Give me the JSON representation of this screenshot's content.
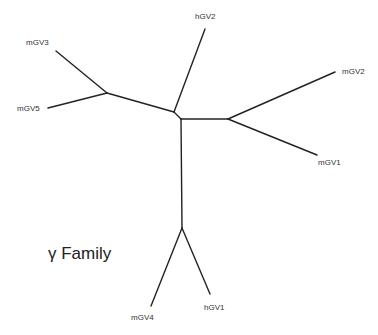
{
  "diagram": {
    "type": "unrooted phylogenetic tree",
    "title": "γ Family",
    "leaves": [
      {
        "id": "mGV3",
        "label": "mGV3"
      },
      {
        "id": "mGV5",
        "label": "mGV5"
      },
      {
        "id": "hGV2",
        "label": "hGV2"
      },
      {
        "id": "mGV2",
        "label": "mGV2"
      },
      {
        "id": "mGV1",
        "label": "mGV1"
      },
      {
        "id": "mGV4",
        "label": "mGV4"
      },
      {
        "id": "hGV1",
        "label": "hGV1"
      }
    ],
    "clades": [
      [
        "mGV3",
        "mGV5"
      ],
      [
        "mGV2",
        "mGV1"
      ],
      [
        "mGV4",
        "hGV1"
      ]
    ],
    "line_color": "#222222"
  }
}
